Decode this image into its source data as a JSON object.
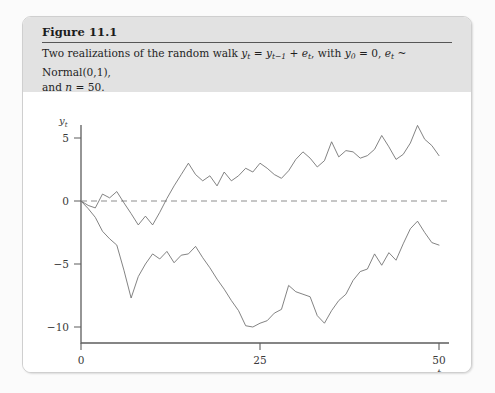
{
  "figure": {
    "title": "Figure 11.1",
    "caption_line1_a": "Two realizations of the random walk ",
    "caption_y": "y",
    "caption_y_sub": "t",
    "caption_eq": " = ",
    "caption_ylag": "y",
    "caption_ylag_sub": "t−1",
    "caption_plus": " + ",
    "caption_e": "e",
    "caption_e_sub": "t",
    "caption_with": ", with ",
    "caption_y0": "y",
    "caption_y0_sub": "0",
    "caption_y0_eq": " = 0, ",
    "caption_et": "e",
    "caption_et_sub": "t",
    "caption_dist": " ~ Normal(0,1),",
    "caption_line2_a": "and ",
    "caption_n": "n",
    "caption_line2_b": " = 50."
  },
  "chart_data": {
    "type": "line",
    "title": "Two realizations of the random walk",
    "xlabel": "t",
    "ylabel": "y_t",
    "xlim": [
      -1,
      51
    ],
    "ylim": [
      -11.5,
      6.6
    ],
    "xticks": [
      0,
      25,
      50
    ],
    "xticklabels": [
      "0",
      "25",
      "50"
    ],
    "yticks": [
      5,
      0,
      -5,
      -10
    ],
    "yticklabels": [
      "5",
      "0",
      "−5",
      "−10"
    ],
    "grid": false,
    "legend": "none",
    "annotations": [
      {
        "type": "hline",
        "y": 0,
        "style": "dashed",
        "label": "zero reference"
      }
    ],
    "x": [
      0,
      1,
      2,
      3,
      4,
      5,
      6,
      7,
      8,
      9,
      10,
      11,
      12,
      13,
      14,
      15,
      16,
      17,
      18,
      19,
      20,
      21,
      22,
      23,
      24,
      25,
      26,
      27,
      28,
      29,
      30,
      31,
      32,
      33,
      34,
      35,
      36,
      37,
      38,
      39,
      40,
      41,
      42,
      43,
      44,
      45,
      46,
      47,
      48,
      49,
      50
    ],
    "series": [
      {
        "name": "Realization 1",
        "values": [
          0.0,
          -0.35,
          -0.55,
          0.55,
          0.25,
          0.75,
          -0.15,
          -1.0,
          -1.9,
          -1.2,
          -1.9,
          -0.9,
          0.2,
          1.2,
          2.1,
          3.0,
          2.1,
          1.6,
          2.0,
          1.2,
          2.3,
          1.6,
          2.0,
          2.6,
          2.3,
          3.0,
          2.6,
          2.1,
          1.8,
          2.4,
          3.3,
          3.9,
          3.4,
          2.7,
          3.2,
          4.7,
          3.5,
          4.0,
          3.9,
          3.4,
          3.6,
          4.1,
          5.2,
          4.3,
          3.3,
          3.7,
          4.6,
          6.0,
          4.9,
          4.4,
          3.6
        ]
      },
      {
        "name": "Realization 2",
        "values": [
          0.0,
          -0.6,
          -1.3,
          -2.4,
          -3.0,
          -3.5,
          -5.5,
          -7.7,
          -6.0,
          -5.0,
          -4.2,
          -4.6,
          -4.0,
          -4.9,
          -4.3,
          -4.2,
          -3.6,
          -4.5,
          -5.3,
          -6.2,
          -7.0,
          -7.9,
          -8.7,
          -9.9,
          -10.0,
          -9.7,
          -9.5,
          -8.9,
          -8.6,
          -6.7,
          -7.2,
          -7.4,
          -7.6,
          -9.1,
          -9.7,
          -8.7,
          -7.9,
          -7.4,
          -6.3,
          -5.6,
          -5.4,
          -4.2,
          -5.1,
          -4.1,
          -4.7,
          -3.4,
          -2.2,
          -1.6,
          -2.5,
          -3.3,
          -3.5
        ]
      }
    ]
  }
}
